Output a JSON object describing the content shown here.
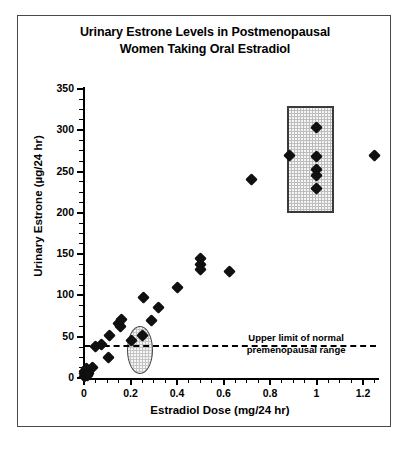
{
  "chart_data": {
    "type": "scatter",
    "title": "Urinary Estrone Levels in Postmenopausal Women Taking Oral Estradiol",
    "title_lines": [
      "Urinary Estrone Levels in Postmenopausal",
      "Women Taking Oral Estradiol"
    ],
    "xlabel": "Estradiol Dose (mg/24 hr)",
    "ylabel": "Urinary Estrone (µg/24 hr)",
    "xlim": [
      0,
      1.3
    ],
    "ylim": [
      0,
      350
    ],
    "xticks": [
      0,
      0.2,
      0.4,
      0.6,
      0.8,
      1,
      1.2
    ],
    "xtick_labels": [
      "0",
      "0.2",
      "0.4",
      "0.6",
      "0.8",
      "1",
      "1.2"
    ],
    "xtick_minor_step": 0.05,
    "yticks": [
      0,
      50,
      100,
      150,
      200,
      250,
      300,
      350
    ],
    "ytick_labels": [
      "0",
      "50",
      "100",
      "150",
      "200",
      "250",
      "300",
      "350"
    ],
    "ytick_minor_step": 12.5,
    "grid": false,
    "legend": null,
    "marker": "diamond",
    "marker_color": "#101010",
    "points": [
      {
        "x": 0.0,
        "y": 2
      },
      {
        "x": 0.0,
        "y": 5
      },
      {
        "x": 0.0,
        "y": 8
      },
      {
        "x": 0.01,
        "y": 12
      },
      {
        "x": 0.015,
        "y": 3
      },
      {
        "x": 0.02,
        "y": 6
      },
      {
        "x": 0.035,
        "y": 13
      },
      {
        "x": 0.05,
        "y": 38
      },
      {
        "x": 0.075,
        "y": 41
      },
      {
        "x": 0.105,
        "y": 25
      },
      {
        "x": 0.11,
        "y": 52
      },
      {
        "x": 0.15,
        "y": 66
      },
      {
        "x": 0.155,
        "y": 62
      },
      {
        "x": 0.16,
        "y": 71
      },
      {
        "x": 0.205,
        "y": 45
      },
      {
        "x": 0.25,
        "y": 51
      },
      {
        "x": 0.255,
        "y": 97
      },
      {
        "x": 0.29,
        "y": 70
      },
      {
        "x": 0.32,
        "y": 85
      },
      {
        "x": 0.4,
        "y": 110
      },
      {
        "x": 0.5,
        "y": 145
      },
      {
        "x": 0.5,
        "y": 138
      },
      {
        "x": 0.5,
        "y": 131
      },
      {
        "x": 0.625,
        "y": 129
      },
      {
        "x": 0.72,
        "y": 240
      },
      {
        "x": 0.885,
        "y": 270
      },
      {
        "x": 1.0,
        "y": 303
      },
      {
        "x": 1.0,
        "y": 268
      },
      {
        "x": 1.0,
        "y": 252
      },
      {
        "x": 1.0,
        "y": 245
      },
      {
        "x": 1.0,
        "y": 230
      },
      {
        "x": 1.25,
        "y": 270
      }
    ],
    "reference_line": {
      "y": 40,
      "style": "dashed",
      "color": "#000000",
      "label_lines": [
        "Upper limit of normal",
        "premenopausal range"
      ]
    },
    "highlight_regions": [
      {
        "name": "rect-highlight",
        "shape": "rectangle",
        "x_range": [
          0.875,
          1.075
        ],
        "y_range": [
          200,
          330
        ],
        "fill": "#bdbdbd",
        "border": "#3a3a3a"
      },
      {
        "name": "oval-highlight",
        "shape": "ellipse",
        "x_range": [
          0.185,
          0.295
        ],
        "y_range": [
          5,
          63
        ],
        "fill": "#c4c4c4",
        "border": "#4a4a4a"
      }
    ]
  }
}
